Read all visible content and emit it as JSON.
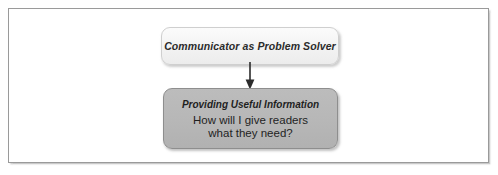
{
  "figure": {
    "type": "flow-diagram",
    "orientation": "vertical",
    "frame": {
      "border_color": "#9a9a9a",
      "background_color": "#ffffff"
    },
    "nodes": [
      {
        "id": "communicator",
        "label": "Communicator as Problem Solver",
        "style": "light",
        "fill_color": "#f4f4f4",
        "border_color": "#cfcfcf",
        "text_color": "#2b2b2b"
      },
      {
        "id": "providing-useful-information",
        "heading": "Providing Useful Information",
        "body_line_1": "How will I give readers",
        "body_line_2": "what they need?",
        "style": "gray",
        "fill_color": "#b7b7b7",
        "border_color": "#8e8e8e",
        "text_color": "#1f1f1f"
      }
    ],
    "connectors": [
      {
        "id": "communicator-to-providing",
        "from": "communicator",
        "to": "providing-useful-information",
        "kind": "arrow-down",
        "color": "#2b2b2b"
      }
    ]
  }
}
